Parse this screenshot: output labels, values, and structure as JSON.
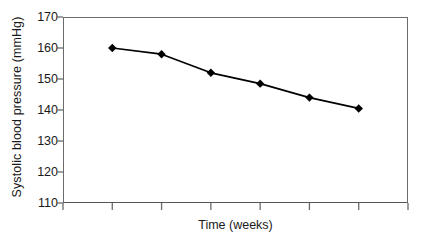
{
  "chart_data": {
    "type": "line",
    "title": "",
    "xlabel": "Time (weeks)",
    "ylabel": "Systolic blood pressure (mmHg)",
    "x": [
      1,
      2,
      3,
      4,
      5,
      6
    ],
    "values": [
      160,
      158,
      152,
      148.5,
      144,
      140.5
    ],
    "series": [
      {
        "name": "Systolic blood pressure",
        "values": [
          160,
          158,
          152,
          148.5,
          144,
          140.5
        ],
        "marker": "diamond",
        "color": "#000000"
      }
    ],
    "ylim": [
      110,
      170
    ],
    "yticks": [
      110,
      120,
      130,
      140,
      150,
      160,
      170
    ],
    "ytick_labels": [
      "110",
      "120",
      "130",
      "140",
      "150",
      "160",
      "170"
    ],
    "xlim": [
      0,
      7
    ],
    "xticks": [
      0,
      1,
      2,
      3,
      4,
      5,
      6,
      7
    ],
    "xtick_labels": [
      "",
      "",
      "",
      "",
      "",
      "",
      "",
      ""
    ],
    "grid": false,
    "legend": false,
    "axis_color": "#6b6b6b",
    "line_color": "#000000",
    "background": "#ffffff"
  }
}
